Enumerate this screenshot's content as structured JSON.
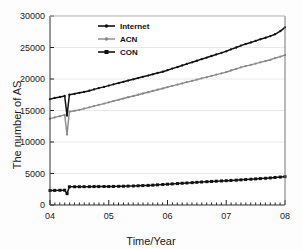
{
  "chart_data": {
    "type": "line",
    "title": "",
    "xlabel": "Time/Year",
    "ylabel": "The number of AS",
    "xlim": [
      4.0,
      8.0
    ],
    "ylim": [
      0,
      30000
    ],
    "xticks": [
      "04",
      "05",
      "06",
      "07",
      "08"
    ],
    "xtick_values": [
      4,
      5,
      6,
      7,
      8
    ],
    "yticks": [
      "0",
      "5000",
      "10000",
      "15000",
      "20000",
      "25000",
      "30000"
    ],
    "ytick_values": [
      0,
      5000,
      10000,
      15000,
      20000,
      25000,
      30000
    ],
    "grid": true,
    "legend_position": "upper-left-inside",
    "minor_xticks": true,
    "x": [
      4.0,
      4.08,
      4.17,
      4.25,
      4.29,
      4.33,
      4.42,
      4.5,
      4.58,
      4.67,
      4.75,
      4.83,
      4.92,
      5.0,
      5.08,
      5.17,
      5.25,
      5.33,
      5.42,
      5.5,
      5.58,
      5.67,
      5.75,
      5.83,
      5.92,
      6.0,
      6.08,
      6.17,
      6.25,
      6.33,
      6.42,
      6.5,
      6.58,
      6.67,
      6.75,
      6.83,
      6.92,
      7.0,
      7.08,
      7.17,
      7.25,
      7.33,
      7.42,
      7.5,
      7.58,
      7.67,
      7.75,
      7.83,
      7.92,
      8.0
    ],
    "series": [
      {
        "name": "Internet",
        "color": "#111111",
        "marker": "dot",
        "values": [
          16800,
          17000,
          17150,
          17300,
          14200,
          17500,
          17650,
          17800,
          17950,
          18150,
          18350,
          18550,
          18750,
          18950,
          19150,
          19350,
          19550,
          19750,
          19950,
          20150,
          20350,
          20550,
          20750,
          20950,
          21150,
          21400,
          21650,
          21900,
          22150,
          22400,
          22650,
          22900,
          23150,
          23400,
          23650,
          23900,
          24150,
          24400,
          24700,
          25000,
          25300,
          25550,
          25800,
          26050,
          26300,
          26550,
          26800,
          27100,
          27600,
          28200
        ]
      },
      {
        "name": "ACN",
        "color": "#8a8a8a",
        "marker": "dot",
        "values": [
          13700,
          13900,
          14100,
          14300,
          11200,
          14800,
          14950,
          15100,
          15300,
          15500,
          15700,
          15900,
          16100,
          16300,
          16500,
          16700,
          16900,
          17100,
          17300,
          17500,
          17700,
          17900,
          18100,
          18300,
          18500,
          18700,
          18900,
          19100,
          19300,
          19500,
          19700,
          19900,
          20100,
          20300,
          20500,
          20700,
          20900,
          21100,
          21350,
          21600,
          21850,
          22050,
          22250,
          22450,
          22650,
          22850,
          23050,
          23300,
          23550,
          23800
        ]
      },
      {
        "name": "CON",
        "color": "#111111",
        "marker": "square",
        "values": [
          2300,
          2320,
          2340,
          2350,
          1800,
          2900,
          2900,
          2900,
          2910,
          2910,
          2920,
          2920,
          2930,
          2930,
          2950,
          2960,
          2980,
          3000,
          3020,
          3050,
          3080,
          3110,
          3150,
          3200,
          3250,
          3300,
          3350,
          3400,
          3450,
          3500,
          3550,
          3600,
          3650,
          3700,
          3740,
          3780,
          3820,
          3860,
          3900,
          3940,
          3990,
          4040,
          4090,
          4140,
          4190,
          4240,
          4300,
          4370,
          4440,
          4500
        ]
      }
    ]
  },
  "legend": {
    "items": [
      {
        "label": "Internet"
      },
      {
        "label": "ACN"
      },
      {
        "label": "CON"
      }
    ]
  }
}
